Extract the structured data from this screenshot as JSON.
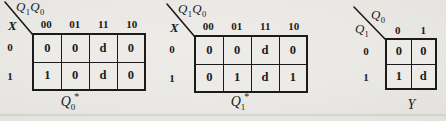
{
  "figure": {
    "kind": "karnaugh-maps",
    "ink_color": "#1b1b1b",
    "paper_color": "#e9e8e4"
  },
  "maps": [
    {
      "name": "next-state-Q0",
      "header": {
        "top": [
          {
            "base": "Q",
            "sub": "1"
          },
          {
            "base": "Q",
            "sub": "0"
          }
        ],
        "side": {
          "base": "X",
          "sub": ""
        }
      },
      "cols": [
        "00",
        "01",
        "11",
        "10"
      ],
      "rows": [
        "0",
        "1"
      ],
      "cells": [
        [
          "0",
          "0",
          "d",
          "0"
        ],
        [
          "1",
          "0",
          "d",
          "0"
        ]
      ],
      "caption": {
        "base": "Q",
        "sub": "0",
        "sup": "*"
      }
    },
    {
      "name": "next-state-Q1",
      "header": {
        "top": [
          {
            "base": "Q",
            "sub": "1"
          },
          {
            "base": "Q",
            "sub": "0"
          }
        ],
        "side": {
          "base": "X",
          "sub": ""
        }
      },
      "cols": [
        "00",
        "01",
        "11",
        "10"
      ],
      "rows": [
        "0",
        "1"
      ],
      "cells": [
        [
          "0",
          "0",
          "d",
          "0"
        ],
        [
          "0",
          "1",
          "d",
          "1"
        ]
      ],
      "caption": {
        "base": "Q",
        "sub": "1",
        "sup": "*"
      }
    },
    {
      "name": "output-Y",
      "header": {
        "top": [
          {
            "base": "Q",
            "sub": "0"
          }
        ],
        "side": {
          "base": "Q",
          "sub": "1"
        }
      },
      "cols": [
        "0",
        "1"
      ],
      "rows": [
        "0",
        "1"
      ],
      "cells": [
        [
          "0",
          "0"
        ],
        [
          "1",
          "d"
        ]
      ],
      "caption": {
        "base": "Y",
        "sub": "",
        "sup": ""
      }
    }
  ]
}
